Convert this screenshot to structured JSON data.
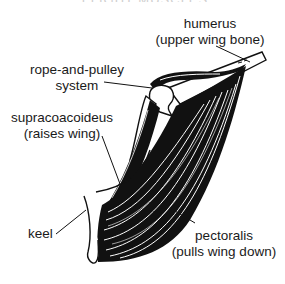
{
  "figure": {
    "title_fragment": "FLIGHT MUSCLES",
    "labels": {
      "humerus": {
        "line1": "humerus",
        "line2": "(upper wing bone)"
      },
      "pulley": {
        "line1": "rope-and-pulley",
        "line2": "system"
      },
      "supracoracoideus": {
        "line1": "supracoacoideus",
        "line2": "(raises wing)"
      },
      "keel": {
        "line1": "keel"
      },
      "pectoralis": {
        "line1": "pectoralis",
        "line2": "(pulls wing down)"
      }
    },
    "colors": {
      "ink": "#111111",
      "background": "#ffffff"
    }
  }
}
